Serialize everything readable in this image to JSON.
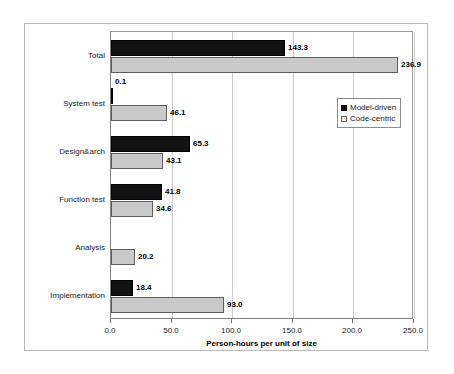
{
  "chart_data": {
    "type": "bar",
    "orientation": "horizontal",
    "title": "",
    "xlabel": "Person-hours per unit of size",
    "ylabel": "",
    "xlim": [
      0.0,
      250.0
    ],
    "xticks": [
      "0.0",
      "50.0",
      "100.0",
      "150.0",
      "200.0",
      "250.0"
    ],
    "xtick_values": [
      0,
      50,
      100,
      150,
      200,
      250
    ],
    "grid": true,
    "legend_position": "upper right inside plot",
    "categories": [
      "Total",
      "System test",
      "Design&arch",
      "Function test",
      "Analysis",
      "Implementation"
    ],
    "series": [
      {
        "name": "Model-driven",
        "color": "#121212",
        "values": [
          143.3,
          0.1,
          65.3,
          41.8,
          null,
          18.4
        ],
        "labels": [
          "143.3",
          "0.1",
          "65.3",
          "41.8",
          "",
          "18.4"
        ]
      },
      {
        "name": "Code-centric",
        "color": "#c9c9c9",
        "values": [
          236.9,
          46.1,
          43.1,
          34.6,
          20.2,
          93.0
        ],
        "labels": [
          "236.9",
          "46.1",
          "43.1",
          "34.6",
          "20.2",
          "93.0"
        ]
      }
    ]
  },
  "legend": {
    "items": [
      {
        "label": "Model-driven",
        "swatch": "filled-black-square-icon"
      },
      {
        "label": "Code-centric",
        "swatch": "outlined-light-square-icon"
      }
    ]
  },
  "colors": {
    "series_model_driven": "#121212",
    "series_code_centric": "#c9c9c9",
    "gridline": "#c9c9c9",
    "axis": "#808080",
    "frame": "#b9b9b9",
    "text": "#1a1a1a",
    "background": "#ffffff"
  }
}
